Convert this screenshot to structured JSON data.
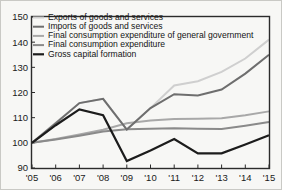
{
  "chart_data": {
    "type": "line",
    "title": "",
    "subtitle": "",
    "xlabel": "",
    "ylabel": "",
    "xlim": [
      2005,
      2015
    ],
    "ylim": [
      90,
      150
    ],
    "grid": false,
    "legend_position": "top-left",
    "x": [
      2005,
      2006,
      2007,
      2008,
      2009,
      2010,
      2011,
      2012,
      2013,
      2014,
      2015
    ],
    "x_tick_labels": [
      "'05",
      "'06",
      "'07",
      "'08",
      "'09",
      "'10",
      "'11",
      "'12",
      "'13",
      "'14",
      "'15"
    ],
    "y_tick_labels": [
      "90",
      "100",
      "110",
      "120",
      "130",
      "140",
      "150"
    ],
    "y_ticks": [
      90,
      100,
      110,
      120,
      130,
      140,
      150
    ],
    "series": [
      {
        "name": "Exports of goods and services",
        "color": "#cfcfcf",
        "width": 2.0,
        "values": [
          100.0,
          108.0,
          115.8,
          117.5,
          105.3,
          113.8,
          122.8,
          124.5,
          128.2,
          133.5,
          141.0
        ]
      },
      {
        "name": "Imports of goods and services",
        "color": "#6e6e6e",
        "width": 2.0,
        "values": [
          100.0,
          107.8,
          115.8,
          117.5,
          105.3,
          113.8,
          119.3,
          118.8,
          121.2,
          127.5,
          135.0
        ]
      },
      {
        "name": "Final consumption expenditure of general government",
        "color": "#a8a8a8",
        "width": 2.0,
        "values": [
          100.0,
          101.5,
          103.3,
          105.2,
          107.8,
          108.9,
          109.5,
          109.6,
          109.8,
          111.0,
          112.5
        ]
      },
      {
        "name": "Final consumption expenditure",
        "color": "#8a8a8a",
        "width": 2.0,
        "values": [
          100.0,
          101.3,
          102.8,
          104.5,
          105.4,
          105.6,
          105.8,
          105.6,
          105.5,
          106.8,
          108.3
        ]
      },
      {
        "name": "Gross capital formation",
        "color": "#1c1c1c",
        "width": 2.2,
        "values": [
          100.0,
          107.0,
          113.3,
          111.0,
          92.8,
          97.0,
          101.5,
          95.8,
          95.8,
          99.3,
          103.0
        ]
      }
    ]
  },
  "legend": {
    "entries": [
      "Exports of goods and services",
      "Imports of goods and services",
      "Final consumption expenditure of general government",
      "Final consumption expenditure",
      "Gross capital formation"
    ]
  },
  "colors": {
    "background": "#f7f7f5",
    "frame": "#2b2b2b",
    "text": "#141414"
  }
}
